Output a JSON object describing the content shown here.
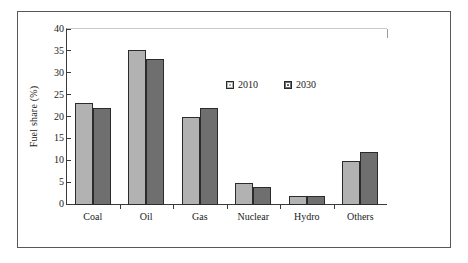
{
  "chart_data": {
    "type": "bar",
    "title": "",
    "xlabel": "",
    "ylabel": "Fuel share (%)",
    "categories": [
      "Coal",
      "Oil",
      "Gas",
      "Nuclear",
      "Hydro",
      "Others"
    ],
    "series": [
      {
        "name": "2010",
        "color": "#b2b2b2",
        "values": [
          23,
          35,
          20,
          5,
          2,
          10
        ]
      },
      {
        "name": "2030",
        "color": "#6f6f6f",
        "values": [
          22,
          33,
          22,
          4,
          2,
          12
        ]
      }
    ],
    "ylim": [
      0,
      40
    ],
    "yticks": [
      0,
      5,
      10,
      15,
      20,
      25,
      30,
      35,
      40
    ],
    "ytick_labels": [
      "0",
      "5",
      "10",
      "15",
      "20",
      "25",
      "30",
      "35",
      "40"
    ],
    "grid": false,
    "legend_position": "upper center",
    "legend_entries": [
      "2010",
      "2030"
    ]
  }
}
